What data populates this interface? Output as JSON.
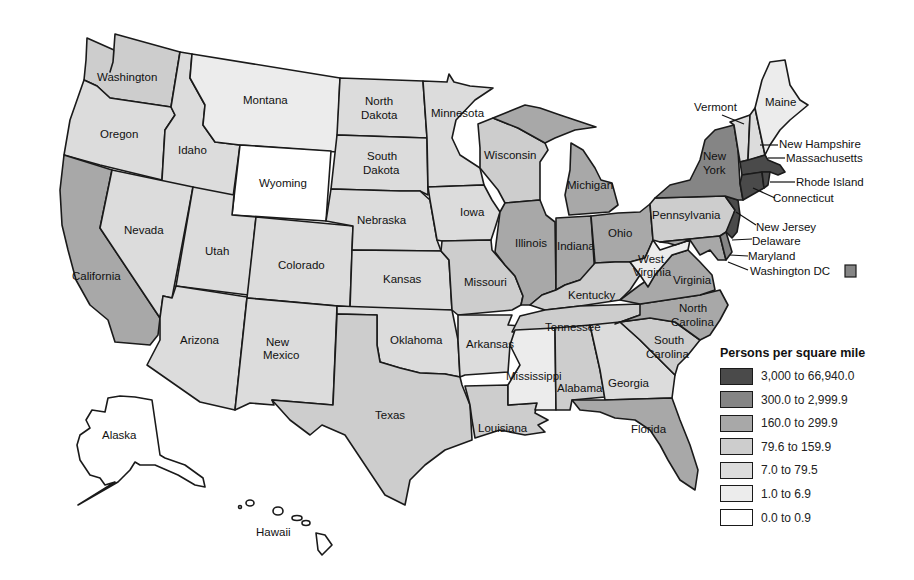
{
  "legend": {
    "title": "Persons per square mile",
    "classes": [
      {
        "label": "3,000 to 66,940.0",
        "color": "#4a4a4a"
      },
      {
        "label": "300.0 to 2,999.9",
        "color": "#858585"
      },
      {
        "label": "160.0 to 299.9",
        "color": "#a8a8a8"
      },
      {
        "label": "79.6 to 159.9",
        "color": "#cdcdcd"
      },
      {
        "label": "7.0 to 79.5",
        "color": "#dcdcdc"
      },
      {
        "label": "1.0 to 6.9",
        "color": "#ececec"
      },
      {
        "label": "0.0 to 0.9",
        "color": "#ffffff"
      }
    ]
  },
  "states": {
    "washington": "Washington",
    "oregon": "Oregon",
    "california": "California",
    "idaho": "Idaho",
    "nevada": "Nevada",
    "montana": "Montana",
    "wyoming": "Wyoming",
    "utah": "Utah",
    "arizona": "Arizona",
    "colorado": "Colorado",
    "new_mexico_1": "New",
    "new_mexico_2": "Mexico",
    "north_dakota_1": "North",
    "north_dakota_2": "Dakota",
    "south_dakota_1": "South",
    "south_dakota_2": "Dakota",
    "nebraska": "Nebraska",
    "kansas": "Kansas",
    "oklahoma": "Oklahoma",
    "texas": "Texas",
    "minnesota": "Minnesota",
    "iowa": "Iowa",
    "missouri": "Missouri",
    "arkansas": "Arkansas",
    "louisiana": "Louisiana",
    "wisconsin": "Wisconsin",
    "illinois": "Illinois",
    "michigan": "Michigan",
    "indiana": "Indiana",
    "ohio": "Ohio",
    "kentucky": "Kentucky",
    "tennessee": "Tennessee",
    "mississippi": "Mississippi",
    "alabama": "Alabama",
    "georgia": "Georgia",
    "florida": "Florida",
    "south_carolina_1": "South",
    "south_carolina_2": "Carolina",
    "north_carolina_1": "North",
    "north_carolina_2": "Carolina",
    "virginia": "Virginia",
    "west_virginia_1": "West",
    "west_virginia_2": "Virginia",
    "pennsylvania": "Pennsylvania",
    "new_york_1": "New",
    "new_york_2": "York",
    "vermont": "Vermont",
    "maine": "Maine",
    "new_hampshire": "New Hampshire",
    "massachusetts": "Massachusetts",
    "rhode_island": "Rhode Island",
    "connecticut": "Connecticut",
    "new_jersey": "New Jersey",
    "delaware": "Delaware",
    "maryland": "Maryland",
    "washington_dc": "Washington DC",
    "alaska": "Alaska",
    "hawaii": "Hawaii"
  }
}
